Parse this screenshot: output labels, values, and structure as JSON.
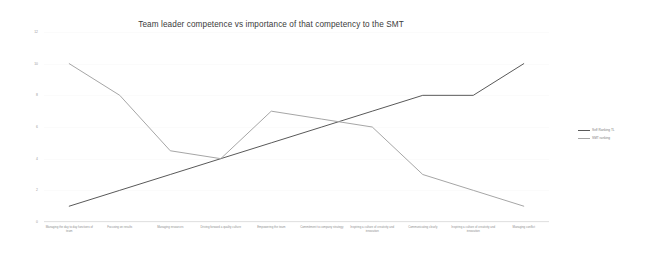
{
  "chart_data": {
    "type": "line",
    "title": "Team leader competence vs importance of that competency to the SMT",
    "xlabel": "",
    "ylabel": "",
    "ylim": [
      0,
      12
    ],
    "yticks": [
      "0",
      "2",
      "4",
      "6",
      "8",
      "10",
      "12"
    ],
    "grid": false,
    "legend_position": "right",
    "categories": [
      "Managing the day to day functions of team",
      "Focusing on  results",
      "Managing resources",
      "Driving forward a quality culture",
      "Empowering the team",
      "Commitment to company strategy",
      "Inspiring a culture of creativity and innovation",
      "Communicating clearly",
      "Inspiring a culture of creativity and innovation",
      "Managing conflict"
    ],
    "series": [
      {
        "name": "Self Ranking TL",
        "color": "#595959",
        "values": [
          1,
          2,
          3,
          4,
          5,
          6,
          7,
          8,
          8,
          10
        ]
      },
      {
        "name": "SMT ranking",
        "color": "#a6a6a6",
        "values": [
          10,
          8,
          4.5,
          4,
          7,
          6.5,
          6,
          3,
          2,
          1
        ]
      }
    ]
  }
}
